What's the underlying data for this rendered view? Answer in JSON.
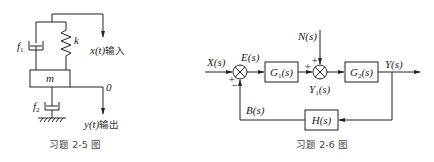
{
  "figure_2_5": {
    "caption": "习题 2-5 图",
    "labels": {
      "damper_top": "f",
      "damper_top_sub": "1",
      "spring": "k",
      "mass": "m",
      "damper_bottom": "f",
      "damper_bottom_sub": "2",
      "input_var": "x(t)",
      "input_text": "输入",
      "zero_ref": "0",
      "output_var": "y(t)",
      "output_text": "输出"
    }
  },
  "figure_2_6": {
    "caption": "习题 2-6 图",
    "signals": {
      "input": "X(s)",
      "error": "E(s)",
      "disturbance": "N(s)",
      "intermediate": "Y",
      "intermediate_sub": "1",
      "intermediate_suffix": "(s)",
      "output": "Y(s)",
      "feedback": "B(s)"
    },
    "blocks": {
      "g1": "G",
      "g1_sub": "1",
      "g1_suffix": "(s)",
      "g2": "G",
      "g2_sub": "2",
      "g2_suffix": "(s)",
      "h": "H(s)"
    },
    "signs": {
      "sum1_plus": "+",
      "sum1_minus": "−",
      "sum2_plus_left": "+",
      "sum2_plus_top": "+"
    }
  }
}
